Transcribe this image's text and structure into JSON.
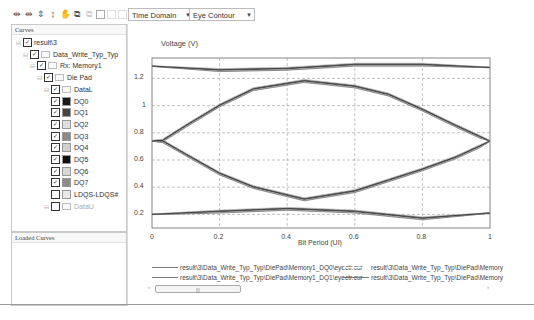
{
  "toolbar": {
    "icons": [
      "zoom-x-icon",
      "zoom-xy-icon",
      "zoom-y-icon",
      "zoom-y-alt-icon",
      "pan-hand-icon",
      "copy-icon",
      "paste-icon",
      "box-icon",
      "disabled-box-icon",
      "disabled-box-icon-2"
    ],
    "domain_select": "Time Domain",
    "view_select": "Eye Contour"
  },
  "curves_panel": {
    "title": "Curves",
    "tree": [
      {
        "label": "result\\3",
        "level": 0,
        "checked": true
      },
      {
        "label": "Data_Write_Typ_Typ",
        "level": 1,
        "checked": true
      },
      {
        "label": "Rx: Memory1",
        "level": 2,
        "checked": true
      },
      {
        "label": "Die Pad",
        "level": 3,
        "checked": true
      },
      {
        "label": "DataL",
        "level": 4,
        "checked": true
      },
      {
        "label": "DQ0",
        "level": 5,
        "checked": true,
        "color": "#1a1a1a"
      },
      {
        "label": "DQ1",
        "level": 5,
        "checked": true,
        "color": "#444444"
      },
      {
        "label": "DQ2",
        "level": 5,
        "checked": true,
        "color": "#e0e0e0"
      },
      {
        "label": "DQ3",
        "level": 5,
        "checked": true,
        "color": "#8a8a8a"
      },
      {
        "label": "DQ4",
        "level": 5,
        "checked": true,
        "color": "#cfcfcf"
      },
      {
        "label": "DQ5",
        "level": 5,
        "checked": true,
        "color": "#111111"
      },
      {
        "label": "DQ6",
        "level": 5,
        "checked": true,
        "color": "#d8d8d8"
      },
      {
        "label": "DQ7",
        "level": 5,
        "checked": true,
        "color": "#8c8c8c"
      },
      {
        "label": "LDQS-LDQS#",
        "level": 5,
        "checked": false,
        "color": "#e8e8e8"
      },
      {
        "label": "DataU",
        "level": 4,
        "checked": false
      }
    ]
  },
  "loaded_panel": {
    "title": "Loaded Curves"
  },
  "chart_data": {
    "type": "line",
    "title": "",
    "ylabel": "Voltage (V)",
    "xlabel": "Bit Period (UI)",
    "xlim": [
      0,
      1
    ],
    "ylim": [
      0.1,
      1.35
    ],
    "x_ticks": [
      "0",
      "0.2",
      "0.4",
      "0.6",
      "0.8",
      "1"
    ],
    "y_ticks": [
      "0.2",
      "0.4",
      "0.6",
      "0.8",
      "1",
      "1.2"
    ],
    "grid": true,
    "series": [
      {
        "name": "eye-top-rail",
        "x": [
          0,
          0.2,
          0.4,
          0.6,
          0.8,
          1
        ],
        "values": [
          1.29,
          1.26,
          1.27,
          1.3,
          1.3,
          1.28
        ]
      },
      {
        "name": "eye-upper",
        "x": [
          0,
          0.03,
          0.1,
          0.2,
          0.3,
          0.45,
          0.6,
          0.7,
          0.8,
          0.9,
          0.97,
          1
        ],
        "values": [
          0.74,
          0.74,
          0.85,
          1.0,
          1.12,
          1.18,
          1.14,
          1.08,
          0.97,
          0.85,
          0.77,
          0.74
        ]
      },
      {
        "name": "eye-lower",
        "x": [
          0,
          0.03,
          0.1,
          0.2,
          0.3,
          0.45,
          0.6,
          0.7,
          0.8,
          0.9,
          0.97,
          1
        ],
        "values": [
          0.74,
          0.74,
          0.64,
          0.5,
          0.4,
          0.31,
          0.37,
          0.45,
          0.53,
          0.62,
          0.7,
          0.74
        ]
      },
      {
        "name": "eye-bottom-rail",
        "x": [
          0,
          0.2,
          0.4,
          0.6,
          0.8,
          1
        ],
        "values": [
          0.2,
          0.22,
          0.24,
          0.22,
          0.17,
          0.21
        ]
      }
    ],
    "legend": [
      "result\\3\\Data_Write_Typ_Typ\\DiePad\\Memory1_DQ0\\eyectr.cur",
      "result\\3\\Data_Write_Typ_Typ\\DiePad\\Memory1_DQ1\\eyectr.cur",
      "result\\3\\Data_Write_Typ_Typ\\DiePad\\Memory",
      "result\\3\\Data_Write_Typ_Typ\\DiePad\\Memory"
    ]
  }
}
